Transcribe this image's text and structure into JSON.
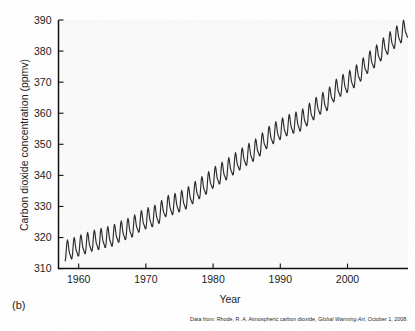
{
  "figure": {
    "panel_label": "(b)",
    "source_note_prefix": "Data from: Rhode, R. A. Atmospheric carbon dioxide, ",
    "source_note_italic": "Global Warming Art",
    "source_note_suffix": ", October 1, 2008."
  },
  "chart_data": {
    "type": "line",
    "title": "",
    "xlabel": "Year",
    "ylabel": "Carbon dioxide concentration (ppmv)",
    "xlim": [
      1957,
      2009
    ],
    "ylim": [
      310,
      390
    ],
    "xticks": [
      1960,
      1970,
      1980,
      1990,
      2000
    ],
    "yticks": [
      310,
      320,
      330,
      340,
      350,
      360,
      370,
      380,
      390
    ],
    "xtick_labels": [
      "1960",
      "1970",
      "1980",
      "1990",
      "2000"
    ],
    "ytick_labels": [
      "310",
      "320",
      "330",
      "340",
      "350",
      "360",
      "370",
      "380",
      "390"
    ],
    "grid": false,
    "legend": false,
    "series_name": "Atmospheric CO2 (Mauna Loa)",
    "line_color": "#2b2b2b",
    "seasonal_amplitude_ppmv": 3.0,
    "annual_means": [
      {
        "x": 1958,
        "y": 315.3
      },
      {
        "x": 1959,
        "y": 315.98
      },
      {
        "x": 1960,
        "y": 316.91
      },
      {
        "x": 1961,
        "y": 317.64
      },
      {
        "x": 1962,
        "y": 318.45
      },
      {
        "x": 1963,
        "y": 318.99
      },
      {
        "x": 1964,
        "y": 319.62
      },
      {
        "x": 1965,
        "y": 320.04
      },
      {
        "x": 1966,
        "y": 321.38
      },
      {
        "x": 1967,
        "y": 322.16
      },
      {
        "x": 1968,
        "y": 323.04
      },
      {
        "x": 1969,
        "y": 324.62
      },
      {
        "x": 1970,
        "y": 325.68
      },
      {
        "x": 1971,
        "y": 326.32
      },
      {
        "x": 1972,
        "y": 327.45
      },
      {
        "x": 1973,
        "y": 329.68
      },
      {
        "x": 1974,
        "y": 330.18
      },
      {
        "x": 1975,
        "y": 331.11
      },
      {
        "x": 1976,
        "y": 332.04
      },
      {
        "x": 1977,
        "y": 333.83
      },
      {
        "x": 1978,
        "y": 335.4
      },
      {
        "x": 1979,
        "y": 336.84
      },
      {
        "x": 1980,
        "y": 338.75
      },
      {
        "x": 1981,
        "y": 340.11
      },
      {
        "x": 1982,
        "y": 341.45
      },
      {
        "x": 1983,
        "y": 343.05
      },
      {
        "x": 1984,
        "y": 344.65
      },
      {
        "x": 1985,
        "y": 346.12
      },
      {
        "x": 1986,
        "y": 347.42
      },
      {
        "x": 1987,
        "y": 349.19
      },
      {
        "x": 1988,
        "y": 351.57
      },
      {
        "x": 1989,
        "y": 353.12
      },
      {
        "x": 1990,
        "y": 354.39
      },
      {
        "x": 1991,
        "y": 355.61
      },
      {
        "x": 1992,
        "y": 356.45
      },
      {
        "x": 1993,
        "y": 357.1
      },
      {
        "x": 1994,
        "y": 358.83
      },
      {
        "x": 1995,
        "y": 360.82
      },
      {
        "x": 1996,
        "y": 362.61
      },
      {
        "x": 1997,
        "y": 363.73
      },
      {
        "x": 1998,
        "y": 366.7
      },
      {
        "x": 1999,
        "y": 368.38
      },
      {
        "x": 2000,
        "y": 369.55
      },
      {
        "x": 2001,
        "y": 371.14
      },
      {
        "x": 2002,
        "y": 373.28
      },
      {
        "x": 2003,
        "y": 375.8
      },
      {
        "x": 2004,
        "y": 377.52
      },
      {
        "x": 2005,
        "y": 379.8
      },
      {
        "x": 2006,
        "y": 381.9
      },
      {
        "x": 2007,
        "y": 383.79
      },
      {
        "x": 2008,
        "y": 385.6
      }
    ]
  }
}
